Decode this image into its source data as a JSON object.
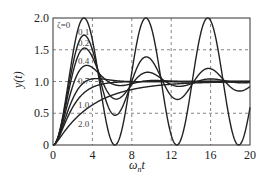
{
  "chart_data": {
    "type": "line",
    "title": "",
    "xlabel": "ω_n t",
    "ylabel": "y(t)",
    "xlim": [
      0,
      20
    ],
    "ylim": [
      0,
      2.0
    ],
    "xticks": [
      "0",
      "4",
      "8",
      "12",
      "16",
      "20"
    ],
    "yticks": [
      "0",
      "0.5",
      "1.0",
      "1.5",
      "2.0"
    ],
    "grid": "dashed",
    "legend": "inline curve labels",
    "series": [
      {
        "name": "ζ=0",
        "zeta": 0
      },
      {
        "name": "0.1",
        "zeta": 0.1
      },
      {
        "name": "0.2",
        "zeta": 0.2
      },
      {
        "name": "0.4",
        "zeta": 0.4
      },
      {
        "name": "0.7",
        "zeta": 0.7
      },
      {
        "name": "1.0",
        "zeta": 1.0
      },
      {
        "name": "2.0",
        "zeta": 2.0
      }
    ],
    "formula": "unit step response of second-order system y(t)=1-e^{-ζω_n t}(cos ω_d t + ζ/√(1-ζ²) sin ω_d t)"
  },
  "labels": {
    "zeta0": "ζ=0",
    "z01": "0.1",
    "z02": "0.2",
    "z04": "0.4",
    "z07": "0.7",
    "z10": "1.0",
    "z20": "2.0",
    "xlabel_main": "ω",
    "xlabel_sub": "n",
    "xlabel_t": "t",
    "ylabel": "y(t)"
  }
}
